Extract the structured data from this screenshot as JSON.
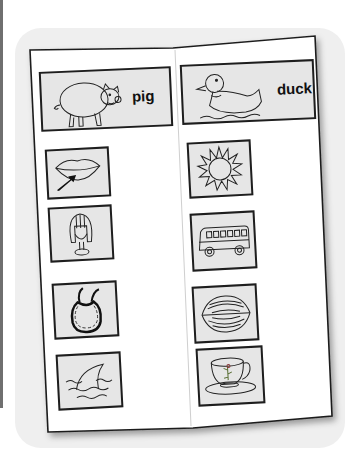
{
  "worksheet": {
    "type": "sound-matching booklet",
    "left_page": {
      "header": {
        "word": "pig",
        "picture": "pig-icon"
      },
      "pictures": [
        {
          "name": "lips",
          "icon": "lips-with-arrow-icon"
        },
        {
          "name": "hair",
          "icon": "hair-wig-icon"
        },
        {
          "name": "bib",
          "icon": "bib-icon"
        },
        {
          "name": "fin",
          "icon": "shark-fin-icon"
        }
      ]
    },
    "right_page": {
      "header": {
        "word": "duck",
        "picture": "duck-icon"
      },
      "pictures": [
        {
          "name": "sun",
          "icon": "sun-icon"
        },
        {
          "name": "bus",
          "icon": "bus-icon"
        },
        {
          "name": "nut",
          "icon": "walnut-icon"
        },
        {
          "name": "cup",
          "icon": "teacup-icon"
        }
      ]
    }
  },
  "colors": {
    "page": "#ffffff",
    "background_card": "#efefef",
    "tile_fill": "#e6e6e6",
    "outline": "#1e1e1e",
    "left_bar": "#6f6f6f"
  }
}
